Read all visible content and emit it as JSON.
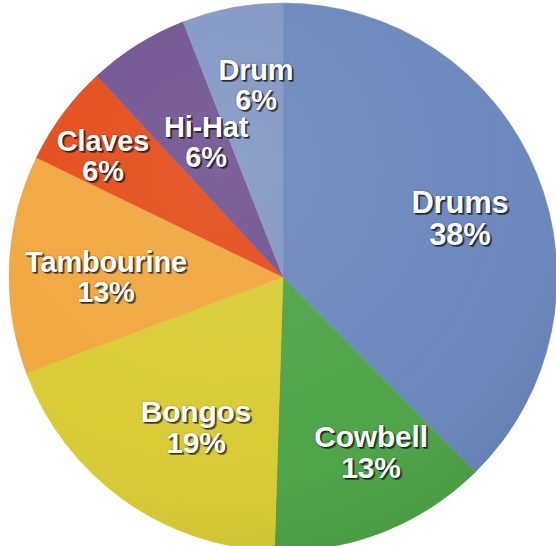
{
  "chart_data": {
    "type": "pie",
    "title": "",
    "subtitle": "",
    "xlabel": "",
    "ylabel": "",
    "legend_position": "none",
    "grid": false,
    "labels_inside_slices": true,
    "start_angle_deg": 0,
    "direction": "clockwise",
    "categories": [
      "Drums",
      "Cowbell",
      "Bongos",
      "Tambourine",
      "Claves",
      "Hi-Hat",
      "Drum"
    ],
    "values": [
      38,
      13,
      19,
      13,
      6,
      6,
      6
    ],
    "value_unit": "%",
    "colors": [
      "#6A86BC",
      "#4CA346",
      "#D9CB33",
      "#F0A63C",
      "#E34A18",
      "#6F5190",
      "#8196C4"
    ],
    "slices": [
      {
        "label": "Drums",
        "percent": 38,
        "percent_text": "38%",
        "color": "#6A86BC"
      },
      {
        "label": "Cowbell",
        "percent": 13,
        "percent_text": "13%",
        "color": "#4CA346"
      },
      {
        "label": "Bongos",
        "percent": 19,
        "percent_text": "19%",
        "color": "#D9CB33"
      },
      {
        "label": "Tambourine",
        "percent": 13,
        "percent_text": "13%",
        "color": "#F0A63C"
      },
      {
        "label": "Claves",
        "percent": 6,
        "percent_text": "6%",
        "color": "#E34A18"
      },
      {
        "label": "Hi-Hat",
        "percent": 6,
        "percent_text": "6%",
        "color": "#6F5190"
      },
      {
        "label": "Drum",
        "percent": 6,
        "percent_text": "6%",
        "color": "#8196C4"
      }
    ],
    "background_color": "#FFFFFF",
    "label_text_color": "#FFFFFF"
  },
  "slice_labels": {
    "drums": {
      "name": "Drums",
      "pct": "38%"
    },
    "cowbell": {
      "name": "Cowbell",
      "pct": "13%"
    },
    "bongos": {
      "name": "Bongos",
      "pct": "19%"
    },
    "tambourine": {
      "name": "Tambourine",
      "pct": "13%"
    },
    "claves": {
      "name": "Claves",
      "pct": "6%"
    },
    "hihat": {
      "name": "Hi-Hat",
      "pct": "6%"
    },
    "drum": {
      "name": "Drum",
      "pct": "6%"
    }
  }
}
